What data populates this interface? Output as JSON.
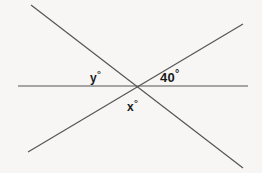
{
  "figure": {
    "background_color": "#f7f6f4",
    "line_color": "#555555",
    "label_color": "#1a1a1a",
    "labels": {
      "y": {
        "text": "y",
        "degree": "°"
      },
      "forty": {
        "text": "40",
        "degree": "°"
      },
      "x": {
        "text": "x",
        "degree": "°"
      }
    },
    "lines": [
      {
        "name": "horizontal-line",
        "x1": 18,
        "y1": 86,
        "x2": 248,
        "y2": 86
      },
      {
        "name": "descending-diagonal-line",
        "x1": 31,
        "y1": 5,
        "x2": 243,
        "y2": 168
      },
      {
        "name": "ascending-diagonal-line",
        "x1": 28,
        "y1": 152,
        "x2": 243,
        "y2": 24
      }
    ],
    "intersection": {
      "x": 134,
      "y": 86
    }
  }
}
